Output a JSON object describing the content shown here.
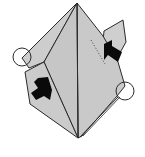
{
  "diagram": {
    "type": "origami-fold-step",
    "colors": {
      "paper": "#c8c8c8",
      "paper_light": "#d2d2d2",
      "line": "#2a2a2a",
      "arrow": "#0a0a0a",
      "background": "#ffffff"
    },
    "elements": {
      "left_circle": "reference-point-left",
      "right_circle": "reference-point-right",
      "left_arrow": "push-arrow-left",
      "right_arrow": "push-arrow-right",
      "dotted_line": "hidden-fold-line"
    }
  }
}
